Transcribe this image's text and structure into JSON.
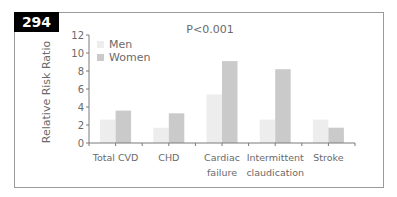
{
  "figure": {
    "label": "294"
  },
  "chart_data": {
    "type": "bar",
    "title": "",
    "annotation": "P<0.001",
    "xlabel": "",
    "ylabel": "Relative Risk Ratio",
    "ylim": [
      0,
      12
    ],
    "yticks": [
      0,
      2,
      4,
      6,
      8,
      10,
      12
    ],
    "categories": [
      "Total CVD",
      "CHD",
      "Cardiac failure",
      "Intermittent claudication",
      "Stroke"
    ],
    "category_lines": [
      [
        "Total CVD"
      ],
      [
        "CHD"
      ],
      [
        "Cardiac",
        "failure"
      ],
      [
        "Intermittent",
        "claudication"
      ],
      [
        "Stroke"
      ]
    ],
    "series": [
      {
        "name": "Men",
        "color": "#ededed",
        "values": [
          2.6,
          1.7,
          5.4,
          2.6,
          2.6
        ]
      },
      {
        "name": "Women",
        "color": "#cacaca",
        "values": [
          3.6,
          3.3,
          9.1,
          8.2,
          1.7
        ]
      }
    ],
    "legend": {
      "position": "upper-left",
      "entries": [
        "Men",
        "Women"
      ]
    },
    "grid": false
  }
}
